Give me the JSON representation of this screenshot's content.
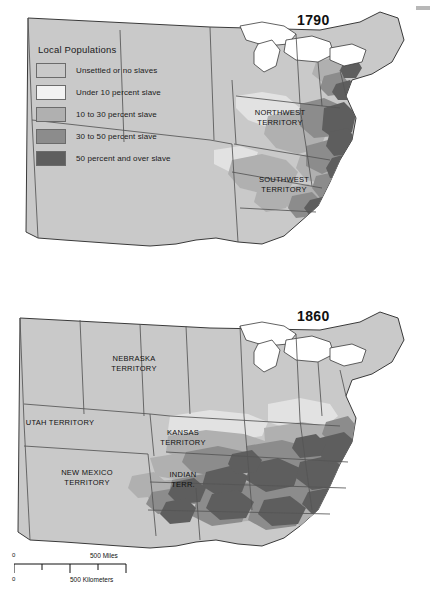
{
  "figure": {
    "corner_artifact": "gray-mark"
  },
  "legend": {
    "title": "Local Populations",
    "items": [
      {
        "label": "Unsettled or no slaves",
        "color": "#c9c9c9"
      },
      {
        "label": "Under 10 percent slave",
        "color": "#f2f2f2"
      },
      {
        "label": "10 to 30 percent slave",
        "color": "#b0b0b0"
      },
      {
        "label": "30 to 50 percent slave",
        "color": "#8c8c8c"
      },
      {
        "label": "50 percent and over slave",
        "color": "#5e5e5e"
      }
    ]
  },
  "maps": [
    {
      "year": "1790",
      "labels": [
        {
          "name": "northwest-territory",
          "text": "NORTHWEST\nTERRITORY",
          "x": 243,
          "y": 108
        },
        {
          "name": "southwest-territory",
          "text": "SOUTHWEST\nTERRITORY",
          "x": 247,
          "y": 175
        }
      ]
    },
    {
      "year": "1860",
      "labels": [
        {
          "name": "nebraska-territory",
          "text": "NEBRASKA\nTERRITORY",
          "x": 95,
          "y": 64
        },
        {
          "name": "utah-territory",
          "text": "UTAH TERRITORY",
          "x": 18,
          "y": 124
        },
        {
          "name": "kansas-territory",
          "text": "KANSAS\nTERRITORY",
          "x": 155,
          "y": 135
        },
        {
          "name": "new-mexico-territory",
          "text": "NEW MEXICO\nTERRITORY",
          "x": 50,
          "y": 176
        },
        {
          "name": "indian-territory",
          "text": "INDIAN\nTERR.",
          "x": 165,
          "y": 177
        }
      ]
    }
  ],
  "scale": {
    "miles_zero": "0",
    "miles_label": "500 Miles",
    "km_zero": "0",
    "km_label": "500 Kilometers"
  },
  "colors": {
    "land_base": "#c9c9c9",
    "water": "#ffffff",
    "border": "#555555",
    "outline": "#3a3a3a",
    "c1": "#c9c9c9",
    "c2": "#f2f2f2",
    "c3": "#b0b0b0",
    "c4": "#8c8c8c",
    "c5": "#5e5e5e"
  }
}
